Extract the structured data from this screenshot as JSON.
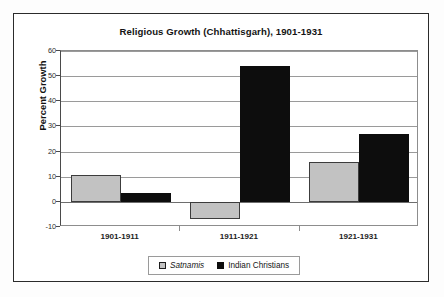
{
  "chart_data": {
    "type": "bar",
    "title": "Religious Growth (Chhattisgarh), 1901-1931",
    "xlabel": "",
    "ylabel": "Percent Growth",
    "categories": [
      "1901-1911",
      "1911-1921",
      "1921-1931"
    ],
    "series": [
      {
        "name": "Satnamis",
        "values": [
          10.5,
          -7,
          16
        ],
        "color": "#c2c2c2"
      },
      {
        "name": "Indian Christians",
        "values": [
          3.5,
          54,
          27
        ],
        "color": "#0d0d0d"
      }
    ],
    "ylim": [
      -10,
      60
    ],
    "ytick_labels": [
      "60",
      "50",
      "40",
      "30",
      "20",
      "10",
      "0",
      "-10"
    ],
    "ytick_values": [
      60,
      50,
      40,
      30,
      20,
      10,
      0,
      -10
    ],
    "grid": true,
    "legend_position": "bottom"
  },
  "legend": {
    "entries": [
      {
        "label": "Satnamis",
        "swatch": "gray-square-swatch"
      },
      {
        "label": "Indian Christians",
        "swatch": "black-square-swatch"
      }
    ]
  }
}
